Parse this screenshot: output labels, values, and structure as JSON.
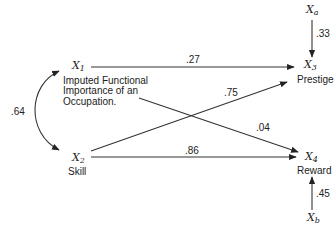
{
  "diagram": {
    "type": "path-diagram",
    "nodes": {
      "x1": {
        "symbol": "X",
        "sub": "1",
        "label_lines": [
          "Imputed Functional",
          "Importance of an",
          "Occupation."
        ]
      },
      "x2": {
        "symbol": "X",
        "sub": "2",
        "label": "Skill"
      },
      "x3": {
        "symbol": "X",
        "sub": "3",
        "label": "Prestige"
      },
      "x4": {
        "symbol": "X",
        "sub": "4",
        "label": "Reward"
      },
      "xa": {
        "symbol": "X",
        "sub": "a"
      },
      "xb": {
        "symbol": "X",
        "sub": "b"
      }
    },
    "edges": [
      {
        "from": "x1",
        "to": "x3",
        "coef": ".27"
      },
      {
        "from": "x1",
        "to": "x4",
        "coef": ".04"
      },
      {
        "from": "x2",
        "to": "x3",
        "coef": ".75"
      },
      {
        "from": "x2",
        "to": "x4",
        "coef": ".86"
      },
      {
        "from": "xa",
        "to": "x3",
        "coef": ".33"
      },
      {
        "from": "xb",
        "to": "x4",
        "coef": ".45"
      },
      {
        "from": "x1",
        "to": "x2",
        "coef": ".64",
        "bidirectional": true
      }
    ],
    "colors": {
      "ink": "#222222",
      "background": "#ffffff"
    }
  }
}
